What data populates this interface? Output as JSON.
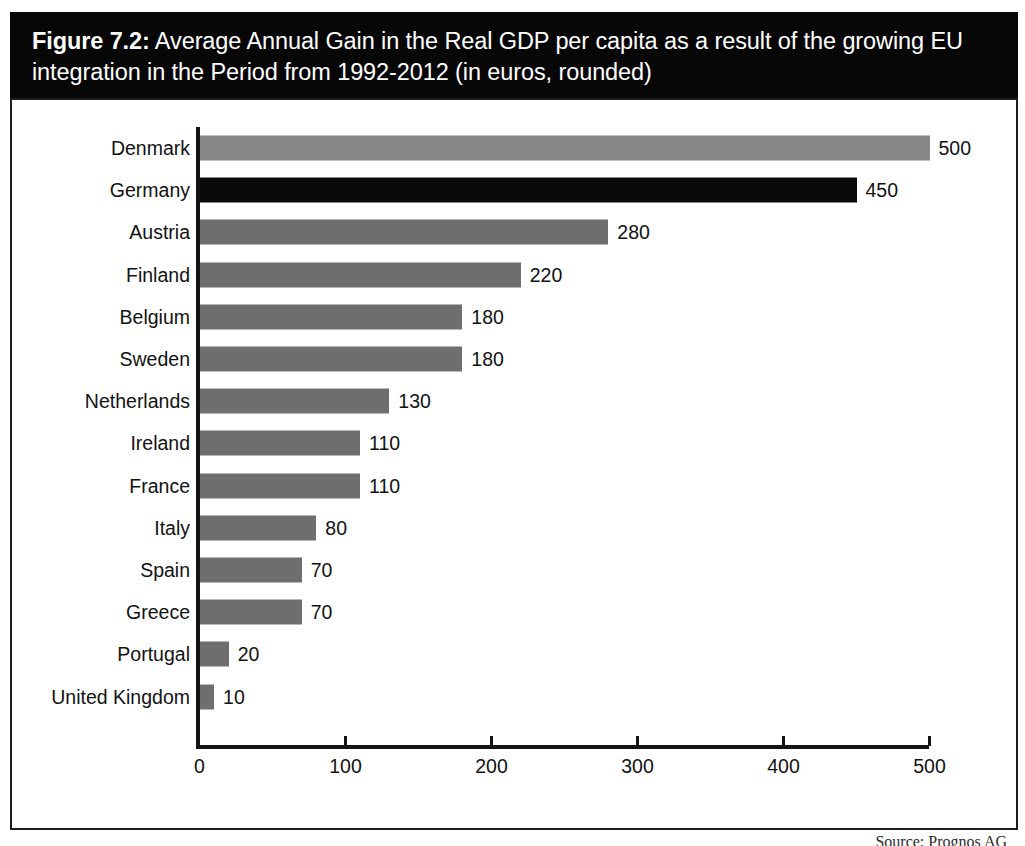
{
  "figure": {
    "number_label": "Figure 7.2:",
    "caption": " Average Annual Gain in the Real GDP per capita as a result of the growing EU integration in the Period from 1992-2012 (in euros, rounded)",
    "source_note": "Source: Prognos AG"
  },
  "colors": {
    "band_background": "#070707",
    "band_text": "#ffffff",
    "bar_default": "#6e6e6e",
    "bar_light": "#878787",
    "bar_highlight": "#0a0a0a",
    "axis": "#141414",
    "frame": "#1d1d1d"
  },
  "chart_data": {
    "type": "bar",
    "orientation": "horizontal",
    "title": "Figure 7.2: Average Annual Gain in the Real GDP per capita as a result of the growing EU integration in the Period from 1992-2012 (in euros, rounded)",
    "xlabel": "",
    "ylabel": "",
    "xlim": [
      0,
      500
    ],
    "grid": false,
    "legend": null,
    "xticks": [
      "0",
      "100",
      "200",
      "300",
      "400",
      "500"
    ],
    "xtick_values": [
      0,
      100,
      200,
      300,
      400,
      500
    ],
    "categories": [
      "Denmark",
      "Germany",
      "Austria",
      "Finland",
      "Belgium",
      "Sweden",
      "Netherlands",
      "Ireland",
      "France",
      "Italy",
      "Spain",
      "Greece",
      "Portugal",
      "United Kingdom"
    ],
    "values": [
      500,
      450,
      280,
      220,
      180,
      180,
      130,
      110,
      110,
      80,
      70,
      70,
      20,
      10
    ],
    "value_labels": [
      "500",
      "450",
      "280",
      "220",
      "180",
      "180",
      "130",
      "110",
      "110",
      "80",
      "70",
      "70",
      "20",
      "10"
    ],
    "bar_styles": [
      "light",
      "highlight",
      "default",
      "default",
      "default",
      "default",
      "default",
      "default",
      "default",
      "default",
      "default",
      "default",
      "default",
      "default"
    ],
    "units": "euros"
  }
}
